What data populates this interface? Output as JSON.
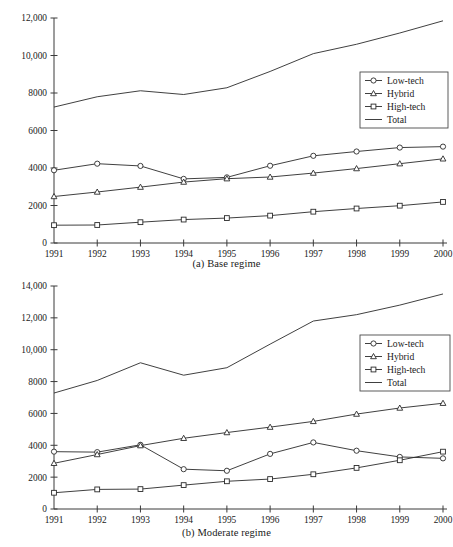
{
  "figure": {
    "background_color": "#ffffff",
    "line_color": "#2a2a2a",
    "axis_color": "#3a3a3a",
    "marker_fill": "#ffffff"
  },
  "panels": [
    {
      "id": "a",
      "caption": "(a) Base regime",
      "legend_position": "right-upper"
    },
    {
      "id": "b",
      "caption": "(b) Moderate regime",
      "legend_position": "right-middle"
    }
  ],
  "legend": {
    "entries": [
      {
        "label": "Low-tech",
        "marker": "circle"
      },
      {
        "label": "Hybrid",
        "marker": "triangle"
      },
      {
        "label": "High-tech",
        "marker": "square"
      },
      {
        "label": "Total",
        "marker": "none"
      }
    ]
  },
  "chart_data": [
    {
      "type": "line",
      "title": "(a) Base regime",
      "xlabel": "",
      "ylabel": "",
      "grid": false,
      "legend_position": "upper right",
      "x": [
        1991,
        1992,
        1993,
        1994,
        1995,
        1996,
        1997,
        1998,
        1999,
        2000
      ],
      "categories": [
        "1991",
        "1992",
        "1993",
        "1994",
        "1995",
        "1996",
        "1997",
        "1998",
        "1999",
        "2000"
      ],
      "xlim": [
        1991,
        2000
      ],
      "ylim": [
        0,
        12000
      ],
      "yticks": [
        0,
        2000,
        4000,
        6000,
        8000,
        10000,
        12000
      ],
      "ytick_labels": [
        "0",
        "2000",
        "4000",
        "6000",
        "8000",
        "10,000",
        "12,000"
      ],
      "series": [
        {
          "name": "Low-tech",
          "marker": "circle",
          "values": [
            3880,
            4230,
            4110,
            3420,
            3500,
            4120,
            4650,
            4880,
            5090,
            5140
          ]
        },
        {
          "name": "Hybrid",
          "marker": "triangle",
          "values": [
            2480,
            2720,
            2980,
            3250,
            3430,
            3520,
            3730,
            3970,
            4230,
            4490
          ]
        },
        {
          "name": "High-tech",
          "marker": "square",
          "values": [
            950,
            960,
            1110,
            1250,
            1330,
            1460,
            1670,
            1840,
            1990,
            2190
          ]
        },
        {
          "name": "Total",
          "marker": "none",
          "values": [
            7250,
            7800,
            8120,
            7920,
            8280,
            9150,
            10100,
            10600,
            11200,
            11850
          ]
        }
      ]
    },
    {
      "type": "line",
      "title": "(b) Moderate regime",
      "xlabel": "",
      "ylabel": "",
      "grid": false,
      "legend_position": "center right",
      "x": [
        1991,
        1992,
        1993,
        1994,
        1995,
        1996,
        1997,
        1998,
        1999,
        2000
      ],
      "categories": [
        "1991",
        "1992",
        "1993",
        "1994",
        "1995",
        "1996",
        "1997",
        "1998",
        "1999",
        "2000"
      ],
      "xlim": [
        1991,
        2000
      ],
      "ylim": [
        0,
        14000
      ],
      "yticks": [
        0,
        2000,
        4000,
        6000,
        8000,
        10000,
        12000,
        14000
      ],
      "ytick_labels": [
        "0",
        "2000",
        "4000",
        "6000",
        "8000",
        "10,000",
        "12,000",
        "14,000"
      ],
      "series": [
        {
          "name": "Low-tech",
          "marker": "circle",
          "values": [
            3600,
            3570,
            4030,
            2500,
            2400,
            3460,
            4180,
            3660,
            3270,
            3180
          ]
        },
        {
          "name": "Hybrid",
          "marker": "triangle",
          "values": [
            2870,
            3420,
            3980,
            4440,
            4800,
            5140,
            5500,
            5960,
            6340,
            6640
          ]
        },
        {
          "name": "High-tech",
          "marker": "square",
          "values": [
            1020,
            1230,
            1250,
            1500,
            1740,
            1880,
            2180,
            2580,
            3060,
            3600
          ]
        },
        {
          "name": "Total",
          "marker": "none",
          "values": [
            7280,
            8070,
            9180,
            8400,
            8870,
            10350,
            11800,
            12200,
            12800,
            13500
          ]
        }
      ]
    }
  ]
}
